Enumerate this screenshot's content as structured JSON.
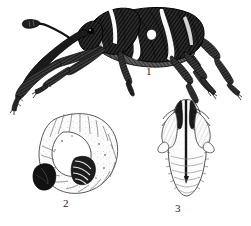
{
  "plate": {
    "kind": "scientific-illustration",
    "medium": "engraving",
    "subject": "weevil life stages",
    "background_color": "#ffffff",
    "ink_color": "#1a1a1a",
    "width_px": 251,
    "height_px": 226,
    "figures": [
      {
        "number": "1",
        "name": "adult-weevil",
        "description": "adult weevil in left lateral view, long downcurved rostrum, dark elytra with pale transverse bands, six long legs with tarsal claws",
        "label_x": 146,
        "label_y": 66
      },
      {
        "number": "2",
        "name": "larva",
        "description": "C-curved legless grub with wrinkled transverse body segments, dark head capsule at lower left, dark striped ventral folds",
        "label_x": 63,
        "label_y": 198
      },
      {
        "number": "3",
        "name": "pupa",
        "description": "pupa in ventral view, rostrum and appendages appressed to body, segmented abdomen",
        "label_x": 175,
        "label_y": 203
      }
    ]
  }
}
